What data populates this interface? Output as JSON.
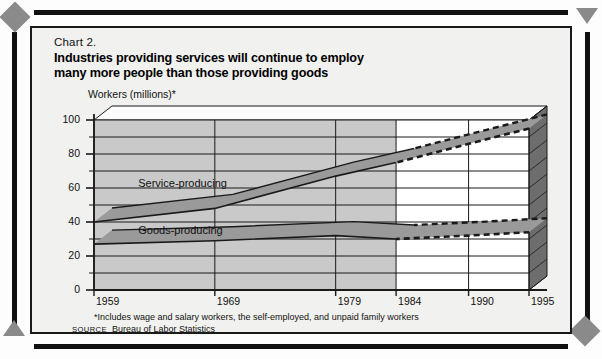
{
  "chart_label": "Chart 2.",
  "title_line1": "Industries providing services will continue to employ",
  "title_line2": "many more people than those providing goods",
  "footnote": "*Includes wage and salary workers, the self-employed, and unpaid family workers",
  "source_keyword": "SOURCE",
  "source_text": "Bureau of Labor Statistics",
  "colors": {
    "historical_fill": "#c9c9c9",
    "projection_fill": "#ffffff",
    "endcap_fill": "#6d6d6d",
    "top_face": "#fbfbfb",
    "line": "#1a1a1a",
    "band": "#9a9a9a",
    "frame": "#111111",
    "card_bg": "#f1f1ef",
    "accent_corner": "#8a8a8a"
  },
  "chart_data": {
    "type": "line",
    "title": "Industries providing services will continue to employ many more people than those providing goods",
    "subtitle": "Chart 2.",
    "xlabel": "",
    "ylabel": "Workers (millions)*",
    "ylim": [
      0,
      100
    ],
    "ytick_labels": [
      "0",
      "20",
      "40",
      "60",
      "80",
      "100"
    ],
    "ytick_values": [
      0,
      20,
      40,
      60,
      80,
      100
    ],
    "yminor_values": [
      10,
      30,
      50,
      70,
      90
    ],
    "xtick_labels": [
      "1959",
      "1969",
      "1979",
      "1984",
      "1990",
      "1995"
    ],
    "xtick_values": [
      1959,
      1969,
      1979,
      1984,
      1990,
      1995
    ],
    "grid": true,
    "legend_position": "inline",
    "projection_start": 1984,
    "projection_note": "Values from 1984 to 1995 are projections, shown with dashed lines on a white background",
    "series": [
      {
        "name": "Service-producing",
        "x": [
          1959,
          1969,
          1979,
          1984,
          1990,
          1995
        ],
        "values": [
          40,
          48,
          67,
          75,
          86,
          95
        ],
        "style": "solid-then-dashed"
      },
      {
        "name": "Goods-producing",
        "x": [
          1959,
          1969,
          1979,
          1984,
          1990,
          1995
        ],
        "values": [
          27,
          29,
          32,
          30,
          32,
          34
        ],
        "style": "solid-then-dashed"
      }
    ],
    "annotations": [
      {
        "text": "Service-producing",
        "x": 1962,
        "y": 62
      },
      {
        "text": "Goods-producing",
        "x": 1962,
        "y": 34
      }
    ]
  }
}
